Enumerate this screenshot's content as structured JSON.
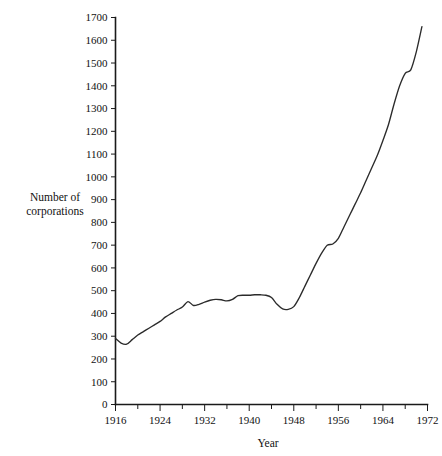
{
  "chart_data": {
    "type": "line",
    "title": "",
    "xlabel": "Year",
    "ylabel": "Number of corporations",
    "ylabel_lines": [
      "Number of",
      "corporations"
    ],
    "xlim": [
      1916,
      1972
    ],
    "ylim": [
      0,
      1700
    ],
    "grid": false,
    "legend": null,
    "y_ticks": [
      0,
      100,
      200,
      300,
      400,
      500,
      600,
      700,
      800,
      900,
      1000,
      1100,
      1200,
      1300,
      1400,
      1500,
      1600,
      1700
    ],
    "y_tick_labels": [
      "0",
      "100",
      "200",
      "300",
      "400",
      "500",
      "600",
      "700",
      "800",
      "900",
      "1000",
      "1100",
      "1200",
      "1300",
      "1400",
      "1500",
      "1600",
      "1700"
    ],
    "x_ticks_major": [
      1916,
      1924,
      1932,
      1940,
      1948,
      1956,
      1964,
      1972
    ],
    "x_tick_labels": [
      "1916",
      "1924",
      "1932",
      "1940",
      "1948",
      "1956",
      "1964",
      "1972"
    ],
    "x_ticks_minor": [
      1920,
      1928,
      1936,
      1944,
      1952,
      1960,
      1968
    ],
    "series": [
      {
        "name": "Number of corporations",
        "color": "#2b2b2b",
        "x": [
          1916,
          1917,
          1918,
          1919,
          1920,
          1921,
          1922,
          1923,
          1924,
          1925,
          1926,
          1927,
          1928,
          1929,
          1930,
          1931,
          1932,
          1933,
          1934,
          1935,
          1936,
          1937,
          1938,
          1939,
          1940,
          1941,
          1942,
          1943,
          1944,
          1945,
          1946,
          1947,
          1948,
          1949,
          1950,
          1951,
          1952,
          1953,
          1954,
          1955,
          1956,
          1957,
          1958,
          1959,
          1960,
          1961,
          1962,
          1963,
          1964,
          1965,
          1966,
          1967,
          1968,
          1969
        ],
        "y": [
          290,
          270,
          265,
          285,
          305,
          320,
          335,
          350,
          365,
          385,
          400,
          415,
          428,
          452,
          435,
          440,
          450,
          458,
          462,
          460,
          455,
          462,
          478,
          480,
          480,
          482,
          482,
          480,
          470,
          440,
          420,
          418,
          430,
          470,
          520,
          570,
          620,
          665,
          700,
          705,
          730,
          780,
          830,
          880,
          930,
          985,
          1040,
          1095,
          1160,
          1230,
          1320,
          1400,
          1455,
          1470
        ]
      }
    ],
    "series_tail": {
      "x": [
        1969,
        1970,
        1971
      ],
      "y": [
        1470,
        1550,
        1660
      ]
    }
  },
  "axes": {
    "axis_color": "#1a1a1a",
    "background": "#ffffff"
  }
}
